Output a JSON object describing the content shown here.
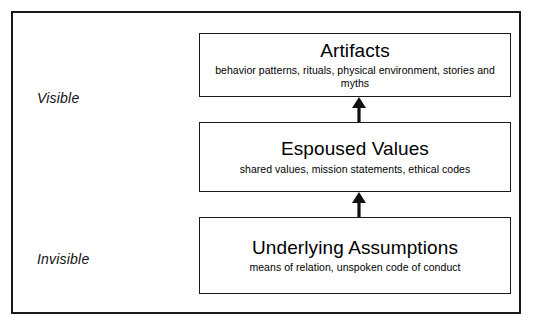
{
  "diagram": {
    "type": "pyramid-levels",
    "side_labels": [
      {
        "id": "visible",
        "text": "Visible"
      },
      {
        "id": "invisible",
        "text": "Invisible"
      }
    ],
    "levels": [
      {
        "id": "artifacts",
        "title": "Artifacts",
        "subtitle": "behavior patterns, rituals, physical environment, stories and myths"
      },
      {
        "id": "espoused-values",
        "title": "Espoused Values",
        "subtitle": "shared values, mission statements, ethical codes"
      },
      {
        "id": "underlying-assumptions",
        "title": "Underlying Assumptions",
        "subtitle": "means of relation, unspoken code of conduct"
      }
    ],
    "arrows": [
      {
        "id": "assumptions-to-values",
        "direction": "up",
        "icon": "up-arrow-icon"
      },
      {
        "id": "values-to-artifacts",
        "direction": "up",
        "icon": "up-arrow-icon"
      }
    ],
    "colors": {
      "stroke": "#1a1a1a",
      "background": "#ffffff",
      "text": "#000000"
    }
  }
}
